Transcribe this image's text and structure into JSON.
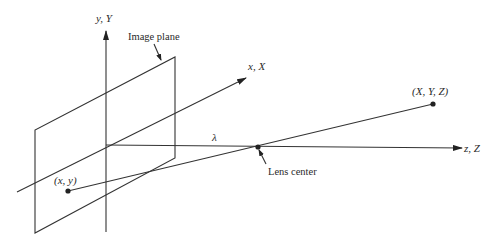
{
  "diagram": {
    "labels": {
      "y_axis": "y, Y",
      "x_axis": "x, X",
      "z_axis": "z, Z",
      "image_plane": "Image plane",
      "lens_center": "Lens center",
      "world_point": "(X, Y, Z)",
      "image_point": "(x, y)",
      "focal_length": "λ"
    },
    "colors": {
      "line": "#333333",
      "text": "#2a2a2a",
      "background": "#ffffff"
    }
  }
}
